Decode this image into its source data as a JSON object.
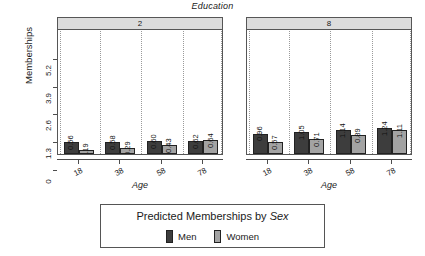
{
  "chart_data": {
    "type": "bar",
    "title": "Education",
    "xlabel": "Age",
    "ylabel": "Memberships",
    "grid": true,
    "legend_position": "bottom",
    "ylim": [
      0,
      5.85
    ],
    "yticks": [
      "0",
      "1.3",
      "2.6",
      "3.9",
      "5.2"
    ],
    "ytick_values": [
      0,
      1.3,
      2.6,
      3.9,
      5.2
    ],
    "categories": [
      "18",
      "38",
      "58",
      "78"
    ],
    "panel_variable": "Education",
    "panels": [
      {
        "label": "2",
        "series": [
          {
            "name": "Men",
            "values": [
              0.56,
              0.58,
              0.6,
              0.62
            ],
            "labels": [
              "0.56",
              "0.58",
              "0.60",
              "0.62"
            ]
          },
          {
            "name": "Women",
            "values": [
              0.19,
              0.29,
              0.43,
              0.64
            ],
            "labels": [
              "0.19",
              "0.29",
              "0.43",
              "0.64"
            ]
          }
        ]
      },
      {
        "label": "8",
        "series": [
          {
            "name": "Men",
            "values": [
              0.96,
              1.05,
              1.14,
              1.24
            ],
            "labels": [
              "0.96",
              "1.05",
              "1.14",
              "1.24"
            ]
          },
          {
            "name": "Women",
            "values": [
              0.57,
              0.71,
              0.89,
              1.11
            ],
            "labels": [
              "0.57",
              "0.71",
              "0.89",
              "1.11"
            ]
          }
        ]
      }
    ],
    "colors": {
      "men": "#3d3d3d",
      "women": "#a3a3a3",
      "strip": "#dcdcdc",
      "axis": "#4d4d4d",
      "grid": "#9a9a9a",
      "background": "#ffffff"
    }
  },
  "legend": {
    "title_prefix": "Predicted Memberships by ",
    "title_emphasis": "Sex",
    "items": [
      {
        "label": "Men",
        "color": "#3d3d3d"
      },
      {
        "label": "Women",
        "color": "#a3a3a3"
      }
    ]
  }
}
